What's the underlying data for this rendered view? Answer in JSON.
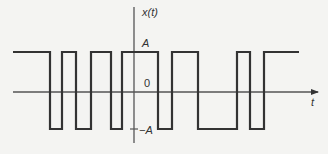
{
  "diagram": {
    "title": "",
    "type": "binary waveform (square wave with random pulse widths)",
    "labels": {
      "y_axis": "x(t)",
      "x_axis": "t",
      "high_level": "A",
      "zero_level": "0",
      "low_level": "−A"
    },
    "colors": {
      "background": "#f4f4f2",
      "stroke": "#333333",
      "axis": "#555555"
    },
    "geometry": {
      "high_y": 52,
      "zero_y": 92,
      "low_y": 129,
      "axis_x": 134,
      "h_axis_start": 13,
      "h_axis_end": 318,
      "v_axis_top": 7,
      "v_axis_bottom": 143
    },
    "waveform_segments": [
      {
        "level": "A",
        "x_start": 13,
        "x_end": 50
      },
      {
        "level": "-A",
        "x_start": 50,
        "x_end": 62
      },
      {
        "level": "A",
        "x_start": 62,
        "x_end": 76
      },
      {
        "level": "-A",
        "x_start": 76,
        "x_end": 91
      },
      {
        "level": "A",
        "x_start": 91,
        "x_end": 111
      },
      {
        "level": "-A",
        "x_start": 111,
        "x_end": 122
      },
      {
        "level": "A",
        "x_start": 122,
        "x_end": 158
      },
      {
        "level": "-A",
        "x_start": 158,
        "x_end": 172
      },
      {
        "level": "A",
        "x_start": 172,
        "x_end": 198
      },
      {
        "level": "-A",
        "x_start": 198,
        "x_end": 237
      },
      {
        "level": "A",
        "x_start": 237,
        "x_end": 250
      },
      {
        "level": "-A",
        "x_start": 250,
        "x_end": 264
      },
      {
        "level": "A",
        "x_start": 264,
        "x_end": 299
      }
    ]
  }
}
